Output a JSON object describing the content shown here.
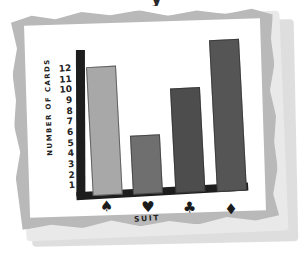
{
  "title_fragment": "y",
  "chart_data": {
    "type": "bar",
    "title": "",
    "xlabel": "SUIT",
    "ylabel": "NUMBER OF CARDS",
    "categories": [
      "spade",
      "heart",
      "club",
      "diamond"
    ],
    "category_glyphs": [
      "♠",
      "♥",
      "♣",
      "♦"
    ],
    "values": [
      11,
      5,
      9,
      13
    ],
    "ylim": [
      0,
      13.5
    ],
    "yticks": [
      12,
      11,
      10,
      9,
      8,
      7,
      6,
      5,
      4,
      3,
      2,
      1
    ],
    "ytick_labels": [
      "12",
      "11",
      "10",
      "9",
      "8",
      "7",
      "6",
      "5",
      "4",
      "3",
      "2",
      "1"
    ],
    "grid": false,
    "legend": false,
    "bar_colors": [
      "#a8a8a8",
      "#6f6f6f",
      "#4d4d4d",
      "#555555"
    ]
  },
  "colors": {
    "ink": "#1d1d1d",
    "frame": "#b9b9b9",
    "paper": "#ffffff",
    "shadow": "#d8d8d8"
  }
}
